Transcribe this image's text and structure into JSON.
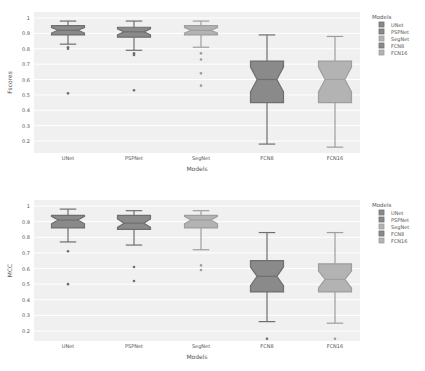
{
  "colors": {
    "background": "#ffffff",
    "plot_bg": "#f0f0f0",
    "grid": "#ffffff",
    "dark_box": "#8a8a8a",
    "dark_line": "#6f6f6f",
    "light_box": "#b3b3b3",
    "light_line": "#9e9e9e",
    "text": "#555555"
  },
  "chart_data": [
    {
      "type": "box",
      "title": "",
      "xlabel": "Models",
      "ylabel": "Fscores",
      "ylim": [
        0.12,
        1.03
      ],
      "yticks": [
        1,
        0.9,
        0.8,
        0.7,
        0.6,
        0.5,
        0.4,
        0.3,
        0.2
      ],
      "ytick_labels": [
        "1",
        "0.9",
        "0.8",
        "0.7",
        "0.6",
        "0.5",
        "0.4",
        "0.3",
        "0.2"
      ],
      "categories": [
        "UNet",
        "PSPNet",
        "SegNet",
        "FCN8",
        "FCN16"
      ],
      "notched": true,
      "legend": {
        "title": "Models",
        "position": "right",
        "entries": [
          "UNet",
          "PSPNet",
          "SegNet",
          "FCN8",
          "FCN16"
        ]
      },
      "series": [
        {
          "name": "UNet",
          "shade": "dark",
          "whisker_high": 0.98,
          "q3": 0.95,
          "median": 0.92,
          "q1": 0.89,
          "whisker_low": 0.83,
          "outliers": [
            0.81,
            0.8,
            0.51
          ]
        },
        {
          "name": "PSPNet",
          "shade": "dark",
          "whisker_high": 0.98,
          "q3": 0.94,
          "median": 0.91,
          "q1": 0.875,
          "whisker_low": 0.79,
          "outliers": [
            0.77,
            0.76,
            0.53
          ]
        },
        {
          "name": "SegNet",
          "shade": "light",
          "whisker_high": 0.98,
          "q3": 0.95,
          "median": 0.92,
          "q1": 0.89,
          "whisker_low": 0.81,
          "outliers": [
            0.77,
            0.73,
            0.64,
            0.56
          ]
        },
        {
          "name": "FCN8",
          "shade": "dark",
          "whisker_high": 0.89,
          "q3": 0.72,
          "median": 0.6,
          "q1": 0.45,
          "whisker_low": 0.18,
          "outliers": []
        },
        {
          "name": "FCN16",
          "shade": "light",
          "whisker_high": 0.88,
          "q3": 0.72,
          "median": 0.6,
          "q1": 0.45,
          "whisker_low": 0.16,
          "outliers": []
        }
      ]
    },
    {
      "type": "box",
      "title": "",
      "xlabel": "Models",
      "ylabel": "MCC",
      "ylim": [
        0.1,
        1.03
      ],
      "yticks": [
        1,
        0.9,
        0.8,
        0.7,
        0.6,
        0.5,
        0.4,
        0.3,
        0.2
      ],
      "ytick_labels": [
        "1",
        "0.9",
        "0.8",
        "0.7",
        "0.6",
        "0.5",
        "0.4",
        "0.3",
        "0.2"
      ],
      "categories": [
        "UNet",
        "PSPNet",
        "SegNet",
        "FCN8",
        "FCN16"
      ],
      "notched": true,
      "legend": {
        "title": "Models",
        "position": "right",
        "entries": [
          "UNet",
          "PSPNet",
          "SegNet",
          "FCN8",
          "FCN16"
        ]
      },
      "series": [
        {
          "name": "UNet",
          "shade": "dark",
          "whisker_high": 0.98,
          "q3": 0.94,
          "median": 0.91,
          "q1": 0.86,
          "whisker_low": 0.77,
          "outliers": [
            0.71,
            0.5
          ]
        },
        {
          "name": "PSPNet",
          "shade": "dark",
          "whisker_high": 0.97,
          "q3": 0.94,
          "median": 0.89,
          "q1": 0.85,
          "whisker_low": 0.75,
          "outliers": [
            0.61,
            0.52
          ]
        },
        {
          "name": "SegNet",
          "shade": "light",
          "whisker_high": 0.97,
          "q3": 0.94,
          "median": 0.91,
          "q1": 0.86,
          "whisker_low": 0.72,
          "outliers": [
            0.62,
            0.59
          ]
        },
        {
          "name": "FCN8",
          "shade": "dark",
          "whisker_high": 0.83,
          "q3": 0.65,
          "median": 0.55,
          "q1": 0.45,
          "whisker_low": 0.26,
          "outliers": [
            0.15
          ]
        },
        {
          "name": "FCN16",
          "shade": "light",
          "whisker_high": 0.83,
          "q3": 0.63,
          "median": 0.53,
          "q1": 0.45,
          "whisker_low": 0.25,
          "outliers": [
            0.15
          ]
        }
      ]
    }
  ]
}
